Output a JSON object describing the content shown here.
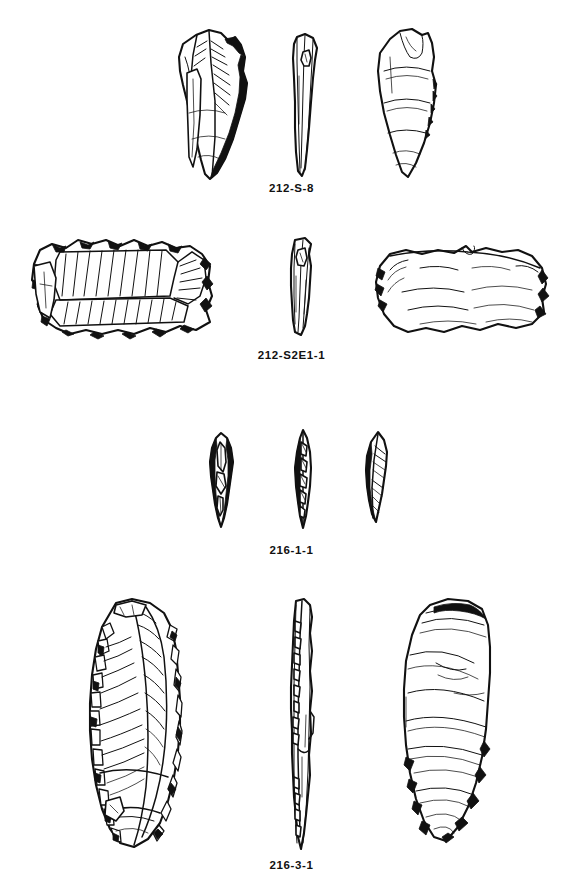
{
  "figure": {
    "kind": "archaeological-lithic-plate",
    "background_color": "#ffffff",
    "ink_color": "#111111",
    "specimen_count": 4,
    "views_per_specimen": 3,
    "view_names": [
      "dorsal",
      "profile",
      "ventral"
    ]
  },
  "specimens": [
    {
      "label": "212-S-8",
      "label_y": 189,
      "description": "retouched flake, pointed distal end, heavy marginal retouch on right edge",
      "views": [
        {
          "name": "dorsal-view",
          "x": 163,
          "y": 27,
          "w": 100,
          "h": 155
        },
        {
          "name": "profile-view",
          "x": 283,
          "y": 32,
          "w": 44,
          "h": 148
        },
        {
          "name": "ventral-view",
          "x": 360,
          "y": 27,
          "w": 92,
          "h": 155
        }
      ]
    },
    {
      "label": "212-S2E1-1",
      "label_y": 356,
      "description": "wide transverse flake with parallel dorsal scars and denticulated margins",
      "views": [
        {
          "name": "dorsal-view",
          "x": 20,
          "y": 232,
          "w": 200,
          "h": 108
        },
        {
          "name": "profile-view",
          "x": 281,
          "y": 236,
          "w": 42,
          "h": 104
        },
        {
          "name": "ventral-view",
          "x": 368,
          "y": 240,
          "w": 185,
          "h": 97
        }
      ]
    },
    {
      "label": "216-1-1",
      "label_y": 551,
      "description": "small elongated point, bifacially retouched, three views",
      "views": [
        {
          "name": "dorsal-view",
          "x": 203,
          "y": 430,
          "w": 38,
          "h": 100
        },
        {
          "name": "profile-view",
          "x": 289,
          "y": 428,
          "w": 28,
          "h": 106
        },
        {
          "name": "ventral-view",
          "x": 358,
          "y": 430,
          "w": 38,
          "h": 98
        }
      ]
    },
    {
      "label": "216-3-1",
      "label_y": 866,
      "description": "large elongated blade tool with continuous retouch on both lateral margins",
      "views": [
        {
          "name": "dorsal-view",
          "x": 76,
          "y": 597,
          "w": 120,
          "h": 255
        },
        {
          "name": "profile-view",
          "x": 282,
          "y": 597,
          "w": 40,
          "h": 258
        },
        {
          "name": "ventral-view",
          "x": 392,
          "y": 597,
          "w": 110,
          "h": 252
        }
      ]
    }
  ]
}
